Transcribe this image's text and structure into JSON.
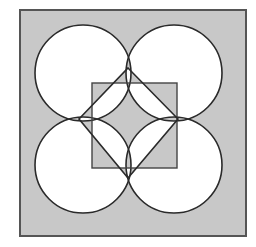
{
  "figure": {
    "colors": {
      "shade": "#c8c8c8",
      "blank": "#ffffff",
      "stroke": "#2a2a2a",
      "outer_stroke": "#555555"
    },
    "outer_square": {
      "x": 20,
      "y": 10,
      "size": 226
    },
    "circles": [
      {
        "cx": 83,
        "cy": 73,
        "r": 48
      },
      {
        "cx": 174,
        "cy": 73,
        "r": 48
      },
      {
        "cx": 83,
        "cy": 165,
        "r": 48
      },
      {
        "cx": 174,
        "cy": 165,
        "r": 48
      }
    ],
    "inner_square": {
      "x": 92,
      "y": 83,
      "size": 85
    },
    "diamond": {
      "points": "128,68 178,119 128,178 79,119"
    }
  }
}
